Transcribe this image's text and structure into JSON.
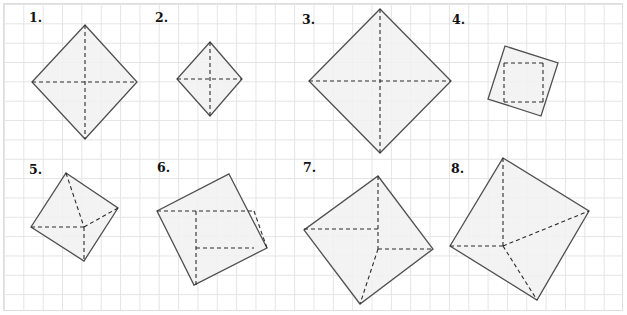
{
  "page": {
    "width": 627,
    "height": 315,
    "background_color": "#ffffff",
    "grid_color": "#e4e4e4",
    "grid_spacing_px": 19.35,
    "frame_color": "#dedede",
    "shape_fill_color": "#f1f1f1",
    "shape_stroke_color": "#4f4f52",
    "dash_stroke_color": "#2b2b2d"
  },
  "shapes": [
    {
      "label": "1.",
      "label_x": 29,
      "label_y": 10,
      "outline": "85,25 137,82 85,139 32,82",
      "dashes": [
        "85,25 85,139",
        "32,82 137,82"
      ]
    },
    {
      "label": "2.",
      "label_x": 155,
      "label_y": 10,
      "outline": "210,42 242,79 210,116 177,79",
      "dashes": [
        "210,42 210,116",
        "177,79 242,79"
      ]
    },
    {
      "label": "3.",
      "label_x": 302,
      "label_y": 12,
      "outline": "380,9 451,81 380,153 309,81",
      "dashes": [
        "380,9 380,153",
        "309,81 451,81"
      ]
    },
    {
      "label": "4.",
      "label_x": 452,
      "label_y": 12,
      "outline": "505,46 558,63 541,116 488,99",
      "dashes": [
        "504,63 543,63",
        "504,102 543,102",
        "504,63 504,102",
        "543,63 543,102"
      ]
    },
    {
      "label": "5.",
      "label_x": 29,
      "label_y": 162,
      "outline": "66,173 118,208 84,261 31,227"
    },
    {
      "label": "6.",
      "label_x": 157,
      "label_y": 160,
      "outline": "229,174 267,248 194,285 157,211"
    },
    {
      "label": "7.",
      "label_x": 303,
      "label_y": 160,
      "outline": "378,176 433,249 360,304 304,230"
    },
    {
      "label": "8.",
      "label_x": 451,
      "label_y": 161,
      "outline": "503,158 589,211 537,300 450,246"
    }
  ],
  "pinwheel_dashes": {
    "5": [
      "31,227 84,227",
      "84,227 84,261",
      "84,227 118,208",
      "66,173 84,227"
    ],
    "6": [
      "157,211 254,211",
      "254,211 267,248",
      "196,211 196,285",
      "196,248 254,248"
    ],
    "7": [
      "378,176 378,249",
      "304,229 378,229",
      "378,249 433,249",
      "378,249 360,304"
    ],
    "8": [
      "503,158 503,246",
      "450,246 503,246",
      "503,246 589,211",
      "503,246 537,300"
    ]
  }
}
